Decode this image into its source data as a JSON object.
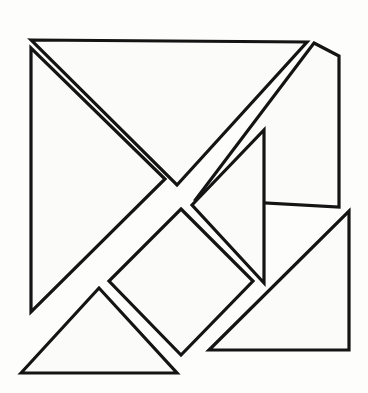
{
  "figure": {
    "type": "line-drawing",
    "canvas": {
      "width": 368,
      "height": 393
    },
    "background_color": "#fdfdfc",
    "stroke_color": "#141414",
    "fill_color": "#fbfbfa",
    "stroke_width": 3.2,
    "piece_count": 7
  },
  "pieces": [
    {
      "id": "large-triangle-upper-left",
      "name": "Large Triangle (upper left)",
      "shape": "right-triangle",
      "points": "31,40 305,42 176,184 176,184 31,40",
      "path": "31,41 303,43 178,184"
    },
    {
      "id": "large-triangle-lower-left",
      "name": "Large Triangle (lower left)",
      "shape": "right-triangle",
      "path": "31,49 31,311 164,180"
    },
    {
      "id": "medium-triangle-bottom",
      "name": "Medium Triangle (bottom)",
      "shape": "right-triangle",
      "path": "22,373 99,289 176,373"
    },
    {
      "id": "large-triangle-upper-right",
      "name": "Large Triangle (upper right)",
      "shape": "right-triangle",
      "path": "312,43 338,55 338,208 195,199"
    },
    {
      "id": "small-triangle-center",
      "name": "Small Triangle (center)",
      "shape": "right-triangle",
      "path": "191,204 263,131 263,283"
    },
    {
      "id": "square-center",
      "name": "Square (rotated, center)",
      "shape": "square",
      "path": "181,208 253,281 181,356 108,281"
    },
    {
      "id": "large-triangle-bottom-right",
      "name": "Large Triangle (bottom right)",
      "shape": "right-triangle",
      "path": "348,212 348,350 208,350"
    }
  ],
  "outline": {
    "name": "Overall square boundary",
    "corners": [
      {
        "label": "top-left",
        "x": 31,
        "y": 40
      },
      {
        "label": "top-right",
        "x": 338,
        "y": 44
      },
      {
        "label": "bottom-right",
        "x": 348,
        "y": 350
      },
      {
        "label": "bottom-left",
        "x": 22,
        "y": 373
      }
    ]
  }
}
